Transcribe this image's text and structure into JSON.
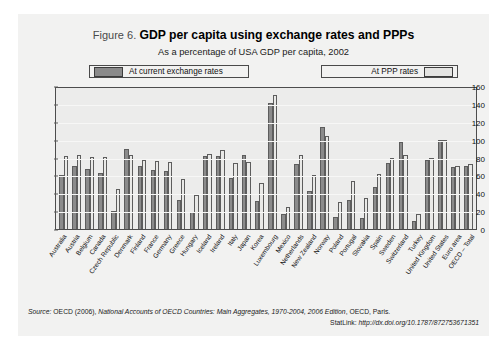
{
  "figure": {
    "number_label": "Figure 6.",
    "title": "GDP per capita using exchange rates and PPPs",
    "subtitle": "As a percentage of USA GDP per capita, 2002"
  },
  "legend": {
    "series1_label": "At current exchange rates",
    "series2_label": "At PPP rates",
    "series1_color": "#8b8b8b",
    "series2_color": "#e9e9e7"
  },
  "source": {
    "label": "Source:",
    "text_before": " OECD (2006), ",
    "publication": "National Accounts of OECD Countries: Main Aggregates, 1970-2004, 2006 Edition",
    "text_after": ", OECD, Paris.",
    "statlink_label": "StatLink:",
    "statlink_url": "http://dx.doi.org/10.1787/872753671351"
  },
  "chart_data": {
    "type": "bar",
    "title": "GDP per capita using exchange rates and PPPs",
    "subtitle": "As a percentage of USA GDP per capita, 2002",
    "xlabel": "",
    "ylabel": "",
    "ylim": [
      0,
      160
    ],
    "yticks": [
      0,
      20,
      40,
      60,
      80,
      100,
      120,
      140,
      160
    ],
    "grid": true,
    "legend_position": "top",
    "categories": [
      "Australia",
      "Austria",
      "Belgium",
      "Canada",
      "Czech Republic",
      "Denmark",
      "Finland",
      "France",
      "Germany",
      "Greece",
      "Hungary",
      "Iceland",
      "Ireland",
      "Italy",
      "Japan",
      "Korea",
      "Luxembourg",
      "Mexico",
      "Netherlands",
      "New Zealand",
      "Norway",
      "Poland",
      "Portugal",
      "Slovakia",
      "Spain",
      "Sweden",
      "Switzerland",
      "Turkey",
      "United Kingdom",
      "United States",
      "Euro area",
      "OECD – Total"
    ],
    "series": [
      {
        "name": "At current exchange rates",
        "values": [
          60,
          71,
          67,
          63,
          20,
          89,
          70,
          66,
          65,
          33,
          19,
          82,
          82,
          57,
          83,
          31,
          141,
          17,
          73,
          43,
          114,
          14,
          33,
          12,
          47,
          74,
          97,
          9,
          77,
          100,
          69,
          70
        ]
      },
      {
        "name": "At PPP rates",
        "values": [
          82,
          83,
          81,
          81,
          45,
          83,
          77,
          76,
          75,
          56,
          38,
          84,
          88,
          74,
          75,
          52,
          150,
          25,
          83,
          60,
          104,
          30,
          54,
          35,
          61,
          79,
          83,
          17,
          79,
          100,
          71,
          73
        ]
      }
    ]
  }
}
